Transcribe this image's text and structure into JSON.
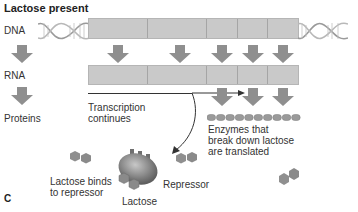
{
  "title": "Lactose present",
  "labels": {
    "dna": "DNA",
    "rna": "RNA",
    "proteins": "Proteins",
    "transcription_line1": "Transcription",
    "transcription_line2": "continues",
    "enzymes_line1": "Enzymes that",
    "enzymes_line2": "break down lactose",
    "enzymes_line3": "are translated",
    "lactose_binds_line1": "Lactose binds",
    "lactose_binds_line2": "to repressor",
    "repressor": "Repressor",
    "lactose": "Lactose",
    "panel": "C"
  },
  "colors": {
    "gene_bar": "#c9c9c9",
    "arrow": "#8f8f8f",
    "hexagon": "#8a8a8a",
    "repressor": "#777777",
    "background": "#ffffff"
  },
  "dna_segments": 5,
  "rna_segments": 4,
  "enzyme_beads": 10
}
